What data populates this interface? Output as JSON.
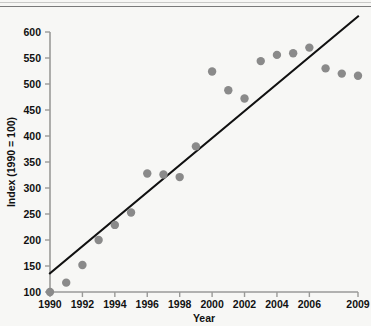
{
  "chart_data": {
    "type": "scatter",
    "title": "",
    "xlabel": "Year",
    "ylabel": "Index (1990 = 100)",
    "xlim": [
      1990,
      2009
    ],
    "ylim": [
      100,
      600
    ],
    "grid": false,
    "legend": null,
    "x_ticks": [
      "1990",
      "1992",
      "1994",
      "1996",
      "1998",
      "2000",
      "2002",
      "2004",
      "2006",
      "2009"
    ],
    "x_tick_values": [
      1990,
      1992,
      1994,
      1996,
      1998,
      2000,
      2002,
      2004,
      2006,
      2009
    ],
    "y_ticks": [
      "100",
      "150",
      "200",
      "250",
      "300",
      "350",
      "400",
      "450",
      "500",
      "550",
      "600"
    ],
    "y_tick_values": [
      100,
      150,
      200,
      250,
      300,
      350,
      400,
      450,
      500,
      550,
      600
    ],
    "marker_color": "#8a8a8a",
    "trendline_color": "#111111",
    "x": [
      1990,
      1991,
      1992,
      1993,
      1994,
      1995,
      1996,
      1997,
      1998,
      1999,
      2000,
      2001,
      2002,
      2003,
      2004,
      2005,
      2006,
      2007,
      2008,
      2009
    ],
    "values": [
      100,
      118,
      152,
      200,
      229,
      253,
      328,
      326,
      321,
      380,
      524,
      488,
      472,
      544,
      556,
      559,
      570,
      530,
      520,
      516
    ],
    "series": [
      {
        "name": "Index (1990 = 100)",
        "x": [
          1990,
          1991,
          1992,
          1993,
          1994,
          1995,
          1996,
          1997,
          1998,
          1999,
          2000,
          2001,
          2002,
          2003,
          2004,
          2005,
          2006,
          2007,
          2008,
          2009
        ],
        "values": [
          100,
          118,
          152,
          200,
          229,
          253,
          328,
          326,
          321,
          380,
          524,
          488,
          472,
          544,
          556,
          559,
          570,
          530,
          520,
          516
        ]
      }
    ],
    "trendline": {
      "type": "line",
      "x": [
        1990,
        2009
      ],
      "values": [
        136,
        630
      ]
    }
  }
}
